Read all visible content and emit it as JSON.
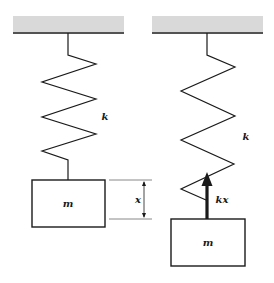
{
  "diagram": {
    "type": "spring-mass system (equilibrium vs. displaced)",
    "colors": {
      "ceiling_fill": "#d9d9d9",
      "line": "#1a1a1a",
      "dimension_line": "#888888"
    },
    "left_panel": {
      "spring_label": "k",
      "mass_label": "m",
      "displacement_label": "x"
    },
    "right_panel": {
      "spring_label": "k",
      "mass_label": "m",
      "force_label": "kx"
    }
  }
}
